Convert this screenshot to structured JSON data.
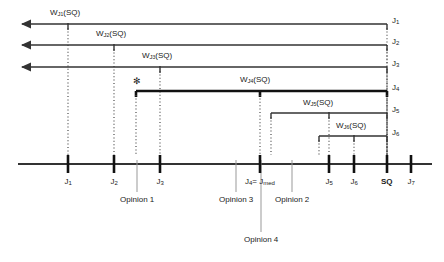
{
  "figure": {
    "type": "number-line-diagram"
  },
  "axis": {
    "label": "judgment-axis",
    "y": 164,
    "x_start": 18,
    "x_end": 432,
    "ticks": [
      {
        "id": "J1",
        "x": 68,
        "label": "J",
        "sub": "1",
        "bold": false
      },
      {
        "id": "J2",
        "x": 114,
        "label": "J",
        "sub": "2",
        "bold": false
      },
      {
        "id": "J3",
        "x": 160,
        "label": "J",
        "sub": "3",
        "bold": false
      },
      {
        "id": "J4",
        "x": 260,
        "label": "J",
        "sub": "4",
        "bold": false,
        "extra": "= J",
        "extra_sub": "med"
      },
      {
        "id": "J5",
        "x": 329,
        "label": "J",
        "sub": "5",
        "bold": false
      },
      {
        "id": "J6",
        "x": 354,
        "label": "J",
        "sub": "6",
        "bold": false
      },
      {
        "id": "SQ",
        "x": 387,
        "label": "SQ",
        "sub": "",
        "bold": true
      },
      {
        "id": "J7",
        "x": 411,
        "label": "J",
        "sub": "7",
        "bold": false
      }
    ]
  },
  "weight_spans": [
    {
      "id": "WJ1",
      "label": "W",
      "sub": "J",
      "subsub": "1",
      "suffix": "(SQ)",
      "y": 24,
      "from": 22,
      "to": 387,
      "arrow": true,
      "bold": false,
      "marker_x": 68,
      "label_x": 50,
      "label_y": 9
    },
    {
      "id": "WJ2",
      "label": "W",
      "sub": "J",
      "subsub": "2",
      "suffix": "(SQ)",
      "y": 45,
      "from": 22,
      "to": 387,
      "arrow": true,
      "bold": false,
      "marker_x": 114,
      "label_x": 96,
      "label_y": 30
    },
    {
      "id": "WJ3",
      "label": "W",
      "sub": "J",
      "subsub": "3",
      "suffix": "(SQ)",
      "y": 67,
      "from": 22,
      "to": 387,
      "arrow": true,
      "bold": false,
      "marker_x": 160,
      "label_x": 142,
      "label_y": 52
    },
    {
      "id": "WJ4",
      "label": "W",
      "sub": "J",
      "subsub": "4",
      "suffix": "(SQ)",
      "y": 91,
      "from": 136,
      "to": 387,
      "arrow": false,
      "bold": true,
      "marker_x": 260,
      "label_x": 240,
      "label_y": 76
    },
    {
      "id": "WJ5",
      "label": "W",
      "sub": "J",
      "subsub": "5",
      "suffix": "(SQ)",
      "y": 113,
      "from": 271,
      "to": 387,
      "arrow": false,
      "bold": false,
      "marker_x": 329,
      "label_x": 303,
      "label_y": 99
    },
    {
      "id": "WJ6",
      "label": "W",
      "sub": "J",
      "subsub": "6",
      "suffix": "(SQ)",
      "y": 136,
      "from": 319,
      "to": 387,
      "arrow": false,
      "bold": false,
      "marker_x": 354,
      "label_x": 336,
      "label_y": 122
    }
  ],
  "endpoint_labels": [
    {
      "id": "end-J1",
      "label": "J",
      "sub": "1",
      "x": 392,
      "y": 17
    },
    {
      "id": "end-J2",
      "label": "J",
      "sub": "2",
      "x": 392,
      "y": 38
    },
    {
      "id": "end-J3",
      "label": "J",
      "sub": "3",
      "x": 392,
      "y": 60
    },
    {
      "id": "end-J4",
      "label": "J",
      "sub": "4",
      "x": 392,
      "y": 84
    },
    {
      "id": "end-J5",
      "label": "J",
      "sub": "5",
      "x": 392,
      "y": 106
    },
    {
      "id": "end-J6",
      "label": "J",
      "sub": "6",
      "x": 392,
      "y": 129
    }
  ],
  "asterisk": {
    "symbol": "✻",
    "x": 133,
    "y": 77
  },
  "opinions": [
    {
      "id": "opinion-1",
      "text": "Opinion 1",
      "line_x": 137,
      "line_top": 160,
      "line_bottom": 192,
      "label_x": 112,
      "label_y": 196
    },
    {
      "id": "opinion-3",
      "text": "Opinion 3",
      "line_x": 236,
      "line_top": 160,
      "line_bottom": 192,
      "label_x": 211,
      "label_y": 196
    },
    {
      "id": "opinion-2",
      "text": "Opinion 2",
      "line_x": 292,
      "line_top": 160,
      "line_bottom": 192,
      "label_x": 267,
      "label_y": 196
    },
    {
      "id": "opinion-4",
      "text": "Opinion 4",
      "line_x": 261,
      "line_top": 160,
      "line_bottom": 232,
      "label_x": 236,
      "label_y": 236
    }
  ],
  "colors": {
    "line": "#333333",
    "bold_line": "#111111",
    "grey_line": "#999999",
    "text": "#1a1a1a",
    "background": "#ffffff"
  }
}
